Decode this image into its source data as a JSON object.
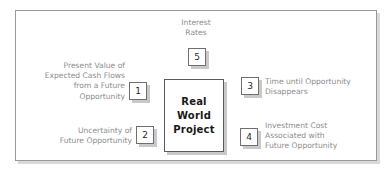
{
  "diagram": {
    "center": {
      "name": "real-world-project",
      "lines": [
        "Real",
        "World",
        "Project"
      ]
    },
    "items": [
      {
        "number": "1",
        "position": "left-top",
        "align": "right",
        "lines": [
          "Present Value of",
          "Expected Cash Flows",
          "from a Future",
          "Opportunity"
        ]
      },
      {
        "number": "2",
        "position": "left-bottom",
        "align": "right",
        "lines": [
          "Uncertainty of",
          "Future Opportunity"
        ]
      },
      {
        "number": "3",
        "position": "right-top",
        "align": "left",
        "lines": [
          "Time until Opportunity",
          "Disappears"
        ]
      },
      {
        "number": "4",
        "position": "right-bottom",
        "align": "left",
        "lines": [
          "Investment Cost",
          "Associated with",
          "Future Opportunity"
        ]
      },
      {
        "number": "5",
        "position": "top-center",
        "align": "center",
        "lines": [
          "Interest",
          "Rates"
        ]
      }
    ],
    "colors": {
      "frame_border": "#9a9a9a",
      "label_text": "#8d8d8d",
      "center_text": "#1a1a1a",
      "number_text": "#2a2a2a",
      "shadow": "#c9c9c9",
      "background": "#ffffff"
    }
  }
}
